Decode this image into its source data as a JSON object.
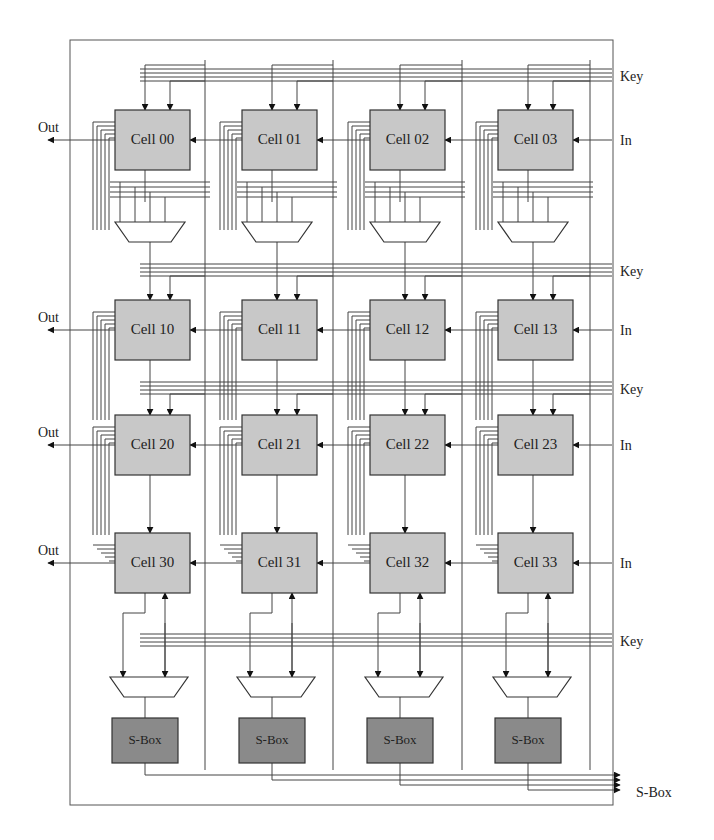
{
  "diagram": {
    "frame": {
      "x": 70,
      "y": 40,
      "w": 543,
      "h": 765
    },
    "colors": {
      "cell_fill": "#c8c8c8",
      "sbox_fill": "#8a8a8a",
      "wire": "#444444"
    },
    "columns_x": [
      115,
      242,
      370,
      498
    ],
    "rows_y": [
      110,
      300,
      415,
      533
    ],
    "cell_size": {
      "w": 75,
      "h": 60
    },
    "cells": [
      [
        "Cell 00",
        "Cell 01",
        "Cell 02",
        "Cell 03"
      ],
      [
        "Cell 10",
        "Cell 11",
        "Cell 12",
        "Cell 13"
      ],
      [
        "Cell 20",
        "Cell 21",
        "Cell 22",
        "Cell 23"
      ],
      [
        "Cell 30",
        "Cell 31",
        "Cell 32",
        "Cell 33"
      ]
    ],
    "sboxes": [
      "S-Box",
      "S-Box",
      "S-Box",
      "S-Box"
    ],
    "labels": {
      "out": "Out",
      "in": "In",
      "key": "Key",
      "sbox_out": "S-Box"
    },
    "key_rows_y": [
      75,
      270,
      388,
      640
    ],
    "out_rows": [
      0,
      1,
      2,
      3
    ],
    "in_rows": [
      0,
      1,
      2,
      3
    ],
    "top_mux_y": 222,
    "bottom_mux_y": 677,
    "sbox_y": 718,
    "sbox_size": {
      "w": 66,
      "h": 45
    }
  }
}
